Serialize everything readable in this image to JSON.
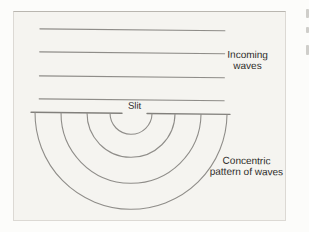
{
  "page_background": "#fcfcfa",
  "figure": {
    "background": "#f5f4f0",
    "line_color": "#8f8d89",
    "barrier_color": "#82807c",
    "text_color": "#2d2c2a",
    "labels": {
      "incoming_line1": "Incoming",
      "incoming_line2": "waves",
      "slit": "Slit",
      "concentric_line1": "Concentric",
      "concentric_line2": "pattern of waves"
    },
    "diagram": {
      "incoming_wave_line_count": 4,
      "wave_line_ys": [
        18,
        41,
        65,
        88
      ],
      "wave_line_x": [
        25,
        210
      ],
      "barrier_y": 101.5,
      "barrier_left_segment": [
        17,
        108
      ],
      "barrier_right_segment": [
        133,
        216
      ],
      "arc_center": [
        117,
        101.5
      ],
      "arc_radii": [
        21,
        44,
        70,
        96
      ]
    }
  }
}
